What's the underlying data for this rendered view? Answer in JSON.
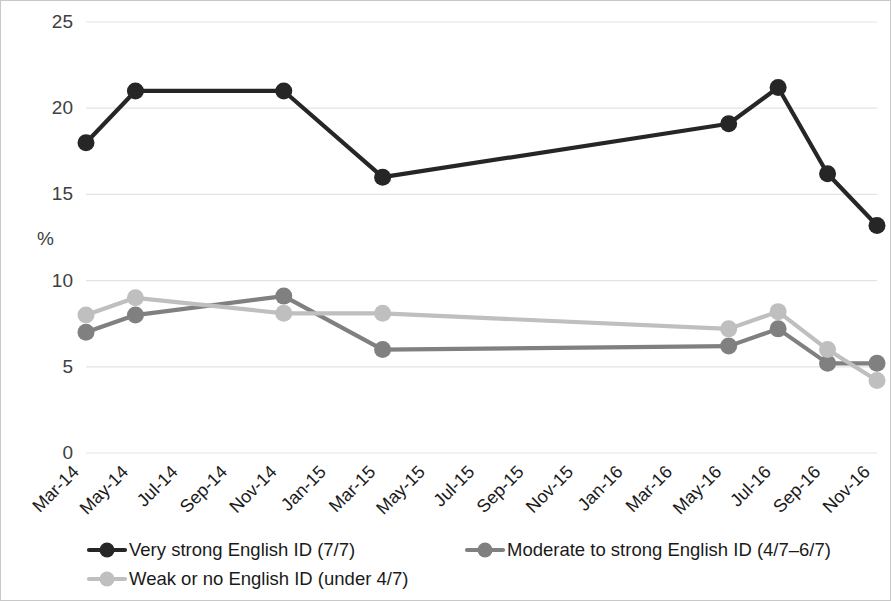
{
  "chart_data": {
    "type": "line",
    "title": "",
    "xlabel": "",
    "ylabel": "%",
    "ylim": [
      0,
      25
    ],
    "ytick_values": [
      0,
      5,
      10,
      15,
      20,
      25
    ],
    "ytick_labels": [
      "0",
      "5",
      "10",
      "15",
      "20",
      "25"
    ],
    "grid": true,
    "legend_position": "bottom",
    "categories": [
      "Mar-14",
      "May-14",
      "Jul-14",
      "Sep-14",
      "Nov-14",
      "Jan-15",
      "Mar-15",
      "May-15",
      "Jul-15",
      "Sep-15",
      "Nov-15",
      "Jan-16",
      "Mar-16",
      "May-16",
      "Jul-16",
      "Sep-16",
      "Nov-16"
    ],
    "series": [
      {
        "name": "Very strong English ID (7/7)",
        "color": "#262626",
        "x": [
          "Mar-14",
          "May-14",
          "Nov-14",
          "Mar-15",
          "May-16",
          "Jul-16",
          "Sep-16",
          "Nov-16"
        ],
        "values": [
          18.0,
          21.0,
          21.0,
          16.0,
          19.1,
          21.2,
          16.2,
          13.2
        ]
      },
      {
        "name": "Moderate to strong English ID (4/7–6/7)",
        "color": "#808080",
        "x": [
          "Mar-14",
          "May-14",
          "Nov-14",
          "Mar-15",
          "May-16",
          "Jul-16",
          "Sep-16",
          "Nov-16"
        ],
        "values": [
          7.0,
          8.0,
          9.1,
          6.0,
          6.2,
          7.2,
          5.2,
          5.2
        ]
      },
      {
        "name": "Weak or no English ID (under 4/7)",
        "color": "#bfbfbf",
        "x": [
          "Mar-14",
          "May-14",
          "Nov-14",
          "Mar-15",
          "May-16",
          "Jul-16",
          "Sep-16",
          "Nov-16"
        ],
        "values": [
          8.0,
          9.0,
          8.1,
          8.1,
          7.2,
          8.2,
          6.0,
          4.2
        ]
      }
    ]
  },
  "legend": {
    "items": [
      {
        "label": "Very strong English ID (7/7)",
        "color": "#262626"
      },
      {
        "label": "Moderate to strong English ID (4/7–6/7)",
        "color": "#808080"
      },
      {
        "label": "Weak or no English ID (under 4/7)",
        "color": "#bfbfbf"
      }
    ]
  },
  "axis": {
    "y_title": "%"
  }
}
